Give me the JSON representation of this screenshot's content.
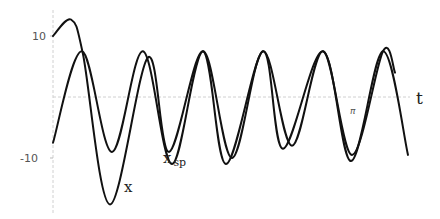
{
  "chart_data": {
    "type": "line",
    "title": "",
    "xlabel": "t",
    "ylabel": "",
    "x_tick_labels": [
      "π"
    ],
    "y_tick_labels": [
      "10",
      "-10"
    ],
    "ylim": [
      -19,
      15
    ],
    "grid": false,
    "legend": "inline curve labels",
    "series": [
      {
        "name": "x",
        "label": "x",
        "description": "transient + oscillation; starts at ~10, peaks ~12.7, dips to ~-17.6, then converges to steady-state x_sp",
        "points": [
          [
            0,
            10
          ],
          [
            0.18,
            12.7
          ],
          [
            0.3,
            7
          ],
          [
            0.57,
            -17.6
          ],
          [
            0.95,
            6.5
          ],
          [
            1.16,
            -9
          ],
          [
            1.5,
            7.5
          ],
          [
            1.73,
            -11
          ],
          [
            2.1,
            7.5
          ],
          [
            2.3,
            -8.5
          ],
          [
            2.7,
            7.5
          ],
          [
            2.98,
            -10.5
          ],
          [
            3.3,
            7.5
          ],
          [
            3.55,
            -9.5
          ]
        ]
      },
      {
        "name": "x_sp",
        "label": "x",
        "subscript": "sp",
        "description": "steady-state periodic oscillation, amplitude ~8.5, period ~0.6",
        "points": [
          [
            0,
            -7.5
          ],
          [
            0.29,
            7.5
          ],
          [
            0.59,
            -9
          ],
          [
            0.9,
            7.5
          ],
          [
            1.19,
            -11
          ],
          [
            1.5,
            7.5
          ],
          [
            1.79,
            -10
          ],
          [
            2.1,
            7.5
          ],
          [
            2.39,
            -8
          ],
          [
            2.7,
            7.5
          ],
          [
            2.99,
            -9.5
          ],
          [
            3.3,
            7.5
          ],
          [
            3.42,
            4
          ]
        ]
      }
    ]
  },
  "labels": {
    "y_top": "10",
    "y_bottom": "-10",
    "x_axis": "t",
    "x_tick": "π",
    "curve_x": "x",
    "curve_xsp_main": "x",
    "curve_xsp_sub": "sp"
  },
  "style": {
    "curve_color": "#111111",
    "axis_color": "#d0d0d0",
    "label_color": "#555555"
  }
}
